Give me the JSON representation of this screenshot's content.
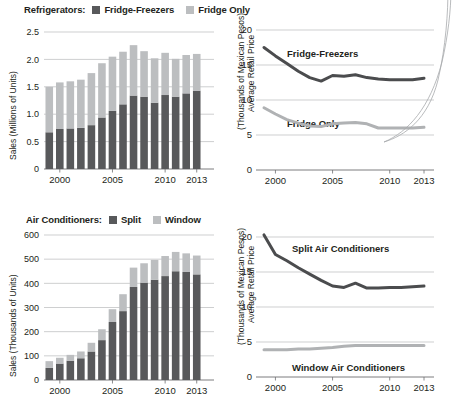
{
  "colors": {
    "dark": "#58595b",
    "light": "#bcbec0",
    "grid": "#b9babc",
    "axis": "#6d6e71",
    "text": "#231f20",
    "callout": "#a7a9ac"
  },
  "panels": {
    "refrigerator_sales": {
      "legend": {
        "category": "Refrigerators:",
        "items": [
          {
            "label": "Fridge-Freezers",
            "swatch": "dark"
          },
          {
            "label": "Fridge Only",
            "swatch": "light"
          }
        ]
      },
      "ylabel_line1": "Sales (Millions of Units)",
      "yticks": [
        "2.5",
        "2.0",
        "1.5",
        "1.0",
        "0.5",
        "0"
      ],
      "xticks": [
        "2000",
        "2005",
        "2010",
        "2013"
      ]
    },
    "refrigerator_price": {
      "ylabel_line1": "Average Retail Price",
      "ylabel_line2": "(Thousands of Mexican Pesos)",
      "yticks": [
        "20",
        "15",
        "10",
        "5",
        "0"
      ],
      "xticks": [
        "2000",
        "2005",
        "2010",
        "2013"
      ],
      "annotations": [
        "Fridge-Freezers",
        "Fridge Only"
      ]
    },
    "airconditioner_sales": {
      "legend": {
        "category": "Air Conditioners:",
        "items": [
          {
            "label": "Split",
            "swatch": "dark"
          },
          {
            "label": "Window",
            "swatch": "light"
          }
        ]
      },
      "ylabel_line1": "Sales (Thousands of Units)",
      "yticks": [
        "600",
        "500",
        "400",
        "300",
        "200",
        "100",
        "0"
      ],
      "xticks": [
        "2000",
        "2005",
        "2010",
        "2013"
      ]
    },
    "airconditioner_price": {
      "ylabel_line1": "Average Retail Price",
      "ylabel_line2": "(Thousands of Mexican Pesos)",
      "yticks": [
        "20",
        "15",
        "10",
        "5",
        "0"
      ],
      "xticks": [
        "2000",
        "2005",
        "2010",
        "2013"
      ],
      "annotations": [
        "Split Air Conditioners",
        "Window Air Conditioners"
      ]
    }
  },
  "chart_data": [
    {
      "id": "refrigerator-sales",
      "type": "bar",
      "stacked": true,
      "title": "Refrigerators:",
      "xlabel": "",
      "ylabel": "Sales (Millions of Units)",
      "ylim": [
        0,
        2.5
      ],
      "yticks": [
        0,
        0.5,
        1.0,
        1.5,
        2.0,
        2.5
      ],
      "grid": true,
      "legend_position": "top",
      "categories": [
        1999,
        2000,
        2001,
        2002,
        2003,
        2004,
        2005,
        2006,
        2007,
        2008,
        2009,
        2010,
        2011,
        2012,
        2013
      ],
      "xtick_labels": [
        "2000",
        "2005",
        "2010",
        "2013"
      ],
      "series": [
        {
          "name": "Fridge-Freezers",
          "color": "#58595b",
          "values": [
            0.67,
            0.73,
            0.74,
            0.75,
            0.8,
            0.94,
            1.06,
            1.18,
            1.34,
            1.32,
            1.21,
            1.35,
            1.32,
            1.38,
            1.43
          ]
        },
        {
          "name": "Fridge Only",
          "color": "#bcbec0",
          "values": [
            0.83,
            0.85,
            0.86,
            0.88,
            0.95,
            0.99,
            0.99,
            0.96,
            0.92,
            0.83,
            0.81,
            0.77,
            0.69,
            0.7,
            0.67
          ]
        }
      ],
      "totals": [
        1.5,
        1.58,
        1.6,
        1.63,
        1.75,
        1.93,
        2.05,
        2.14,
        2.26,
        2.15,
        2.02,
        2.12,
        2.01,
        2.08,
        2.1
      ]
    },
    {
      "id": "refrigerator-price",
      "type": "line",
      "title": "",
      "xlabel": "",
      "ylabel": "Average Retail Price (Thousands of Mexican Pesos)",
      "ylim": [
        0,
        20
      ],
      "yticks": [
        0,
        5,
        10,
        15,
        20
      ],
      "grid": true,
      "legend_position": "inline-annotation",
      "x": [
        1999,
        2000,
        2001,
        2002,
        2003,
        2004,
        2005,
        2006,
        2007,
        2008,
        2009,
        2010,
        2011,
        2012,
        2013
      ],
      "xtick_labels": [
        "2000",
        "2005",
        "2010",
        "2013"
      ],
      "series": [
        {
          "name": "Fridge-Freezers",
          "color": "#4b4c4e",
          "values": [
            17.5,
            16.3,
            15.2,
            14.1,
            13.2,
            12.7,
            13.5,
            13.4,
            13.6,
            13.2,
            13.0,
            12.9,
            12.9,
            12.9,
            13.1
          ]
        },
        {
          "name": "Fridge Only",
          "color": "#b0b2b4",
          "values": [
            8.9,
            8.0,
            7.2,
            6.7,
            6.3,
            6.2,
            6.6,
            6.7,
            6.8,
            6.6,
            6.0,
            6.0,
            6.0,
            6.0,
            6.1
          ]
        }
      ]
    },
    {
      "id": "airconditioner-sales",
      "type": "bar",
      "stacked": true,
      "title": "Air Conditioners:",
      "xlabel": "",
      "ylabel": "Sales (Thousands of Units)",
      "ylim": [
        0,
        600
      ],
      "yticks": [
        0,
        100,
        200,
        300,
        400,
        500,
        600
      ],
      "grid": true,
      "legend_position": "top",
      "categories": [
        1999,
        2000,
        2001,
        2002,
        2003,
        2004,
        2005,
        2006,
        2007,
        2008,
        2009,
        2010,
        2011,
        2012,
        2013
      ],
      "xtick_labels": [
        "2000",
        "2005",
        "2010",
        "2013"
      ],
      "series": [
        {
          "name": "Split",
          "color": "#58595b",
          "values": [
            50,
            68,
            80,
            90,
            118,
            165,
            240,
            285,
            385,
            403,
            415,
            430,
            450,
            447,
            437
          ]
        },
        {
          "name": "Window",
          "color": "#bcbec0",
          "values": [
            28,
            24,
            24,
            28,
            36,
            45,
            53,
            70,
            80,
            80,
            82,
            83,
            80,
            77,
            78
          ]
        }
      ],
      "totals": [
        78,
        92,
        104,
        118,
        154,
        210,
        293,
        355,
        465,
        483,
        497,
        513,
        530,
        524,
        515
      ]
    },
    {
      "id": "airconditioner-price",
      "type": "line",
      "title": "",
      "xlabel": "",
      "ylabel": "Average Retail Price (Thousands of Mexican Pesos)",
      "ylim": [
        0,
        20
      ],
      "yticks": [
        0,
        5,
        10,
        15,
        20
      ],
      "grid": true,
      "legend_position": "inline-annotation",
      "x": [
        1999,
        2000,
        2001,
        2002,
        2003,
        2004,
        2005,
        2006,
        2007,
        2008,
        2009,
        2010,
        2011,
        2012,
        2013
      ],
      "xtick_labels": [
        "2000",
        "2005",
        "2010",
        "2013"
      ],
      "series": [
        {
          "name": "Split Air Conditioners",
          "color": "#4b4c4e",
          "values": [
            20.3,
            17.5,
            16.6,
            15.6,
            14.7,
            13.8,
            13.0,
            12.8,
            13.4,
            12.7,
            12.7,
            12.8,
            12.8,
            12.9,
            13.0
          ]
        },
        {
          "name": "Window Air Conditioners",
          "color": "#b0b2b4",
          "values": [
            3.9,
            3.9,
            3.9,
            4.0,
            4.0,
            4.1,
            4.2,
            4.4,
            4.5,
            4.5,
            4.5,
            4.5,
            4.5,
            4.5,
            4.5
          ]
        }
      ]
    }
  ]
}
